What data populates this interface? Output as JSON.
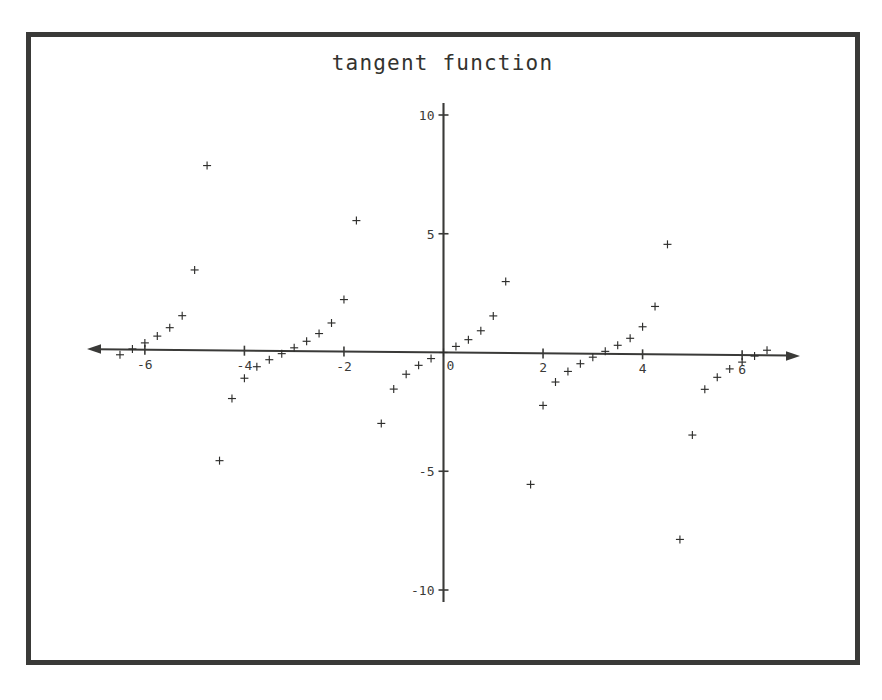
{
  "figure": {
    "title": "tangent function",
    "frame_color": "#3a3a38",
    "background": "#ffffff",
    "marker_color": "#2e2e2c",
    "axis_color": "#3a3a38"
  },
  "chart_data": {
    "type": "scatter",
    "title": "tangent function",
    "xlabel": "",
    "ylabel": "",
    "xlim": [
      -6.6,
      6.6
    ],
    "ylim": [
      -10,
      10
    ],
    "grid": false,
    "legend": null,
    "marker": "+",
    "function": "y = tan(x)",
    "sample_step": 0.25,
    "x_ticks": [
      -6,
      -4,
      -2,
      0,
      2,
      4,
      6
    ],
    "x_tick_labels": [
      "-6",
      "-4",
      "-2",
      "0",
      "2",
      "4",
      "6"
    ],
    "y_ticks": [
      -10,
      -5,
      0,
      5,
      10
    ],
    "y_tick_labels": [
      "-10",
      "-5",
      "0",
      "5",
      "10"
    ],
    "x": [
      -6.5,
      -6.25,
      -6.0,
      -5.75,
      -5.5,
      -5.25,
      -5.0,
      -4.75,
      -4.5,
      -4.25,
      -4.0,
      -3.75,
      -3.5,
      -3.25,
      -3.0,
      -2.75,
      -2.5,
      -2.25,
      -2.0,
      -1.75,
      -1.5,
      -1.25,
      -1.0,
      -0.75,
      -0.5,
      -0.25,
      0.0,
      0.25,
      0.5,
      0.75,
      1.0,
      1.25,
      1.5,
      1.75,
      2.0,
      2.25,
      2.5,
      2.75,
      3.0,
      3.25,
      3.5,
      3.75,
      4.0,
      4.25,
      4.5,
      4.75,
      5.0,
      5.25,
      5.5,
      5.75,
      6.0,
      6.25,
      6.5
    ],
    "y": [
      -0.22,
      0.03,
      0.29,
      0.58,
      0.94,
      1.45,
      3.38,
      7.78,
      -4.64,
      -2.02,
      -1.16,
      -0.67,
      -0.37,
      -0.11,
      0.14,
      0.42,
      0.75,
      1.2,
      2.19,
      5.52,
      -14.1,
      -3.01,
      -1.56,
      -0.93,
      -0.55,
      -0.26,
      0.0,
      0.26,
      0.55,
      0.93,
      1.56,
      3.01,
      14.1,
      -5.52,
      -2.19,
      -1.2,
      -0.75,
      -0.42,
      -0.14,
      0.11,
      0.37,
      0.67,
      1.16,
      2.02,
      4.64,
      -7.78,
      -3.38,
      -1.45,
      -0.94,
      -0.58,
      -0.29,
      -0.03,
      0.22
    ],
    "clipped_points_note": "values beyond |y| > 10 are not drawn"
  }
}
